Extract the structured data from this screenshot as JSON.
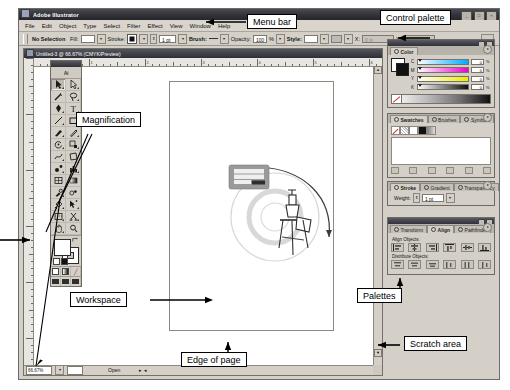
{
  "app": {
    "title": "Adobe Illustrator",
    "window_buttons": [
      "minimize",
      "maximize",
      "close"
    ]
  },
  "menubar": {
    "items": [
      "File",
      "Edit",
      "Object",
      "Type",
      "Select",
      "Filter",
      "Effect",
      "View",
      "Window",
      "Help"
    ]
  },
  "control_palette": {
    "selection_status": "No Selection",
    "fill_label": "Fill:",
    "stroke_label": "Stroke:",
    "stroke_weight": "1 pt",
    "brush_label": "Brush:",
    "opacity_label": "Opacity:",
    "opacity_value": "100",
    "opacity_unit": "%",
    "style_label": "Style:",
    "x_label": "X:",
    "x_value": "0 in",
    "y_label": "Y:",
    "y_value": "0 in"
  },
  "document": {
    "title": "Untitled-3 @ 66.67% (CMYK/Preview)",
    "zoom": "66.67%",
    "status": "Open",
    "ruler_units": [
      "1",
      "2",
      "3",
      "4",
      "5",
      "6"
    ],
    "artwork": {
      "banner_text": "YOUR COMPANY NAME",
      "sub_text": "company"
    }
  },
  "toolbox": {
    "logo": "Ai",
    "tools": [
      "selection-tool",
      "direct-selection-tool",
      "magic-wand-tool",
      "lasso-tool",
      "pen-tool",
      "type-tool",
      "line-segment-tool",
      "rectangle-tool",
      "paintbrush-tool",
      "pencil-tool",
      "rotate-tool",
      "scale-tool",
      "warp-tool",
      "free-transform-tool",
      "symbol-sprayer-tool",
      "column-graph-tool",
      "mesh-tool",
      "gradient-tool",
      "eyedropper-tool",
      "blend-tool",
      "live-paint-bucket-tool",
      "live-paint-selection-tool",
      "slice-tool",
      "scissors-tool",
      "hand-tool",
      "zoom-tool"
    ],
    "fill_color": "#ffffff",
    "stroke_color": "#000000",
    "screen_modes": [
      "standard-screen-mode",
      "full-screen-with-menubar",
      "full-screen-mode"
    ]
  },
  "palettes": {
    "color": {
      "tab": "Color",
      "channels": [
        {
          "label": "C",
          "value": "0",
          "unit": "%"
        },
        {
          "label": "M",
          "value": "0",
          "unit": "%"
        },
        {
          "label": "Y",
          "value": "0",
          "unit": "%"
        },
        {
          "label": "K",
          "value": "0",
          "unit": "%"
        }
      ]
    },
    "swatches": {
      "tabs": [
        "Swatches",
        "Brushes",
        "Symbols"
      ],
      "active": "Swatches"
    },
    "stroke": {
      "tabs": [
        "Stroke",
        "Gradient",
        "Transparency"
      ],
      "active": "Stroke",
      "weight_label": "Weight:",
      "weight_value": "1 pt"
    },
    "align": {
      "tabs": [
        "Transform",
        "Align",
        "Pathfinder"
      ],
      "active": "Align",
      "align_objects_label": "Align Objects:",
      "distribute_objects_label": "Distribute Objects:"
    }
  },
  "callouts": [
    {
      "id": "menu-bar",
      "label": "Menu bar"
    },
    {
      "id": "control-palette",
      "label": "Control palette"
    },
    {
      "id": "magnification",
      "label": "Magnification"
    },
    {
      "id": "workspace",
      "label": "Workspace"
    },
    {
      "id": "palettes",
      "label": "Palettes"
    },
    {
      "id": "edge-of-page",
      "label": "Edge of page"
    },
    {
      "id": "scratch-area",
      "label": "Scratch area"
    }
  ]
}
